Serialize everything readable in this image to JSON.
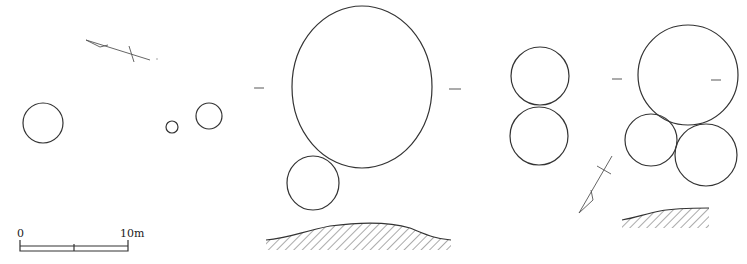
{
  "scale_bar": {
    "label_start": "0",
    "label_end": "10m",
    "x_start": 20,
    "x_mid": 74,
    "x_end": 128,
    "y": 245
  },
  "colors": {
    "line": "#333333",
    "hatch": "#555555"
  },
  "left_plan": {
    "north_arrow": {
      "tail": [
        150,
        60
      ],
      "head": [
        86,
        40
      ],
      "cross": [
        132,
        53
      ]
    },
    "circles": [
      {
        "cx": 43,
        "cy": 123,
        "r": 20
      },
      {
        "cx": 172,
        "cy": 127,
        "r": 6
      },
      {
        "cx": 209,
        "cy": 116,
        "r": 13
      }
    ]
  },
  "middle_plan": {
    "ellipses": [
      {
        "cx": 362,
        "cy": 87,
        "rx": 70,
        "ry": 81
      },
      {
        "cx": 313,
        "cy": 183,
        "rx": 26,
        "ry": 27
      }
    ],
    "section_marks": [
      {
        "x1": 254,
        "y1": 88,
        "x2": 264,
        "y2": 88
      },
      {
        "x1": 449,
        "y1": 89,
        "x2": 461,
        "y2": 89
      }
    ],
    "profile": {
      "x_start": 266,
      "x_end": 451,
      "base_y": 250
    }
  },
  "right_plan": {
    "circles": [
      {
        "cx": 540,
        "cy": 76,
        "r": 29
      },
      {
        "cx": 539,
        "cy": 136,
        "r": 29
      },
      {
        "cx": 688,
        "cy": 75,
        "r": 50
      },
      {
        "cx": 651,
        "cy": 140,
        "r": 26
      },
      {
        "cx": 706,
        "cy": 155,
        "r": 31
      }
    ],
    "section_marks": [
      {
        "x1": 612,
        "y1": 79,
        "x2": 622,
        "y2": 79
      },
      {
        "x1": 711,
        "y1": 80,
        "x2": 721,
        "y2": 80
      }
    ],
    "north_arrow": {
      "tail": [
        612,
        156
      ],
      "head": [
        579,
        213
      ],
      "cross": [
        603,
        170
      ]
    },
    "profile": {
      "x_start": 622,
      "x_end": 709,
      "base_y": 228
    }
  }
}
